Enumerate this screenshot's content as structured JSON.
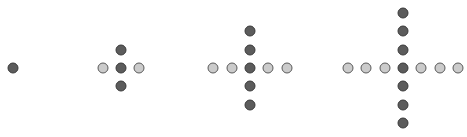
{
  "diagram": {
    "colors": {
      "dark": "#5c5c5c",
      "light": "#cbcbcb",
      "border": "#3a3a3a"
    },
    "spacing": 18.3,
    "groups": [
      {
        "name": "pattern-1",
        "center": [
          13,
          68
        ],
        "arm_length": 0,
        "horizontal_color": "light",
        "vertical_color": "dark"
      },
      {
        "name": "pattern-2",
        "center": [
          121,
          68
        ],
        "arm_length": 1,
        "horizontal_color": "light",
        "vertical_color": "dark"
      },
      {
        "name": "pattern-3",
        "center": [
          250,
          68
        ],
        "arm_length": 2,
        "horizontal_color": "light",
        "vertical_color": "dark"
      },
      {
        "name": "pattern-4",
        "center": [
          403,
          68
        ],
        "arm_length": 3,
        "horizontal_color": "light",
        "vertical_color": "dark"
      }
    ]
  }
}
